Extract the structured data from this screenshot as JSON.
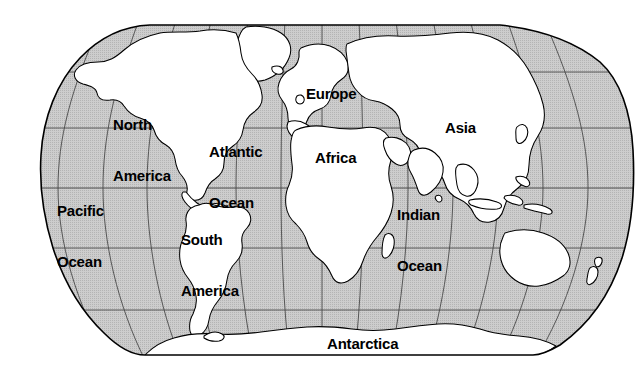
{
  "map": {
    "title": "World Map",
    "projection": "robinson",
    "colors": {
      "ocean_fill": "#c9c9c9",
      "land_fill": "#ffffff",
      "outline": "#000000",
      "graticule": "#3a3a3a",
      "label_text": "#000000",
      "background": "#ffffff"
    },
    "frame": {
      "left": 10,
      "right": 633,
      "top": 25,
      "bottom": 355,
      "equator_y": 188
    },
    "graticule": {
      "latitude_lines": [
        25,
        72,
        128,
        188,
        248,
        310,
        355
      ],
      "meridian_count": 13,
      "grid_visible": true
    },
    "labels": [
      {
        "id": "north-america",
        "text": "North\nAmerica",
        "x": 113,
        "y": 82,
        "lines": [
          "North",
          "America"
        ]
      },
      {
        "id": "atlantic-ocean",
        "text": "Atlantic\nOcean",
        "x": 209,
        "y": 109,
        "lines": [
          "Atlantic",
          "Ocean"
        ]
      },
      {
        "id": "pacific-ocean",
        "text": "Pacific\nOcean",
        "x": 57,
        "y": 168,
        "lines": [
          "Pacific",
          "Ocean"
        ]
      },
      {
        "id": "south-america",
        "text": "South\nAmerica",
        "x": 181,
        "y": 197,
        "lines": [
          "South",
          "America"
        ]
      },
      {
        "id": "europe",
        "text": "Europe",
        "x": 306,
        "y": 85,
        "lines": [
          "Europe"
        ]
      },
      {
        "id": "africa",
        "text": "Africa",
        "x": 315,
        "y": 149,
        "lines": [
          "Africa"
        ]
      },
      {
        "id": "asia",
        "text": "Asia",
        "x": 445,
        "y": 119,
        "lines": [
          "Asia"
        ]
      },
      {
        "id": "indian-ocean",
        "text": "Indian\nOcean",
        "x": 397,
        "y": 172,
        "lines": [
          "Indian",
          "Ocean"
        ]
      },
      {
        "id": "antarctica",
        "text": "Antarctica",
        "x": 327,
        "y": 335,
        "lines": [
          "Antarctica"
        ]
      }
    ],
    "label_texts": {
      "north_america_l1": "North",
      "north_america_l2": "America",
      "atlantic_l1": "Atlantic",
      "atlantic_l2": "Ocean",
      "pacific_l1": "Pacific",
      "pacific_l2": "Ocean",
      "south_america_l1": "South",
      "south_america_l2": "America",
      "europe": "Europe",
      "africa": "Africa",
      "asia": "Asia",
      "indian_l1": "Indian",
      "indian_l2": "Ocean",
      "antarctica": "Antarctica"
    }
  }
}
